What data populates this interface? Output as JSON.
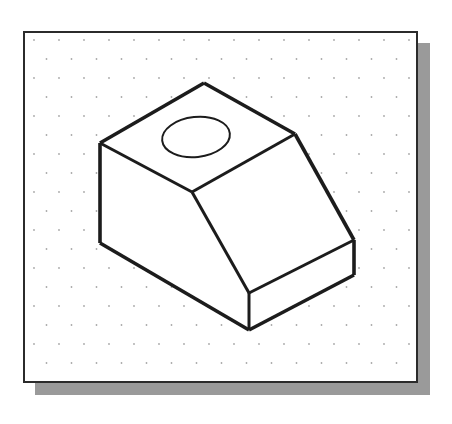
{
  "canvas": {
    "width": 452,
    "height": 424,
    "background": "#ffffff"
  },
  "drawing": {
    "title": "Isometric Sketch of Wedge Block with Counterbore Hole",
    "description": "Hand-drawn style isometric pictorial of a rectangular block with an inclined front face and a circular through hole on the top face, sketched on isometric dot paper.",
    "projection": "isometric",
    "line_color": "#1c1c1c",
    "face_color": "#ffffff"
  },
  "sheet": {
    "name": "isometric-dot-paper",
    "x": 23,
    "y": 31,
    "width": 395,
    "height": 352,
    "border_color": "#2b2b2b",
    "border_width": 2,
    "background": "#ffffff",
    "shadow": {
      "color": "#9a9a9a",
      "offset_x": 12,
      "offset_y": 12
    }
  },
  "grid": {
    "name": "isometric-dot-grid",
    "dot_color": "#a8a8a8",
    "dot_radius": 0.9,
    "spacing_x": 25,
    "spacing_y": 19,
    "stagger": true,
    "columns": 17,
    "rows": 20
  },
  "geometry": {
    "vertices": {
      "top_apex": [
        204,
        83
      ],
      "top_left": [
        100,
        143
      ],
      "top_right": [
        295,
        134
      ],
      "mid_junction": [
        192,
        192
      ],
      "slope_bottom_front": [
        249,
        293
      ],
      "slope_bottom_right": [
        354,
        240
      ],
      "front_bottom": [
        249,
        330
      ],
      "right_bottom": [
        354,
        275
      ],
      "left_bottom": [
        100,
        243
      ]
    },
    "faces": [
      {
        "name": "top-face",
        "points": "100,143 204,83 295,134 192,192"
      },
      {
        "name": "inclined-face",
        "points": "192,192 295,134 354,240 249,293"
      },
      {
        "name": "left-side-face",
        "points": "100,143 192,192 249,293 249,330 100,243"
      },
      {
        "name": "front-bottom-face",
        "points": "249,293 354,240 354,275 249,330"
      }
    ],
    "edges": [
      {
        "name": "top-left-edge",
        "path": "M100,143 L204,83"
      },
      {
        "name": "top-right-edge",
        "path": "M204,83 L295,134"
      },
      {
        "name": "top-inner-left-edge",
        "path": "M100,143 L192,192"
      },
      {
        "name": "top-inner-right-edge",
        "path": "M192,192 L295,134"
      },
      {
        "name": "incline-left-edge",
        "path": "M192,192 L249,293"
      },
      {
        "name": "incline-right-edge",
        "path": "M295,134 L354,240"
      },
      {
        "name": "incline-bottom-edge",
        "path": "M249,293 L354,240"
      },
      {
        "name": "left-vertical-edge",
        "path": "M100,143 L100,243"
      },
      {
        "name": "front-vertical-edge",
        "path": "M249,293 L249,330"
      },
      {
        "name": "right-vertical-edge",
        "path": "M354,240 L354,275"
      },
      {
        "name": "bottom-left-edge",
        "path": "M100,243 L249,330"
      },
      {
        "name": "bottom-right-edge",
        "path": "M249,330 L354,275"
      }
    ],
    "hole": {
      "name": "top-face-hole",
      "shape": "ellipse",
      "center_x": 196,
      "center_y": 137,
      "radius_x": 34,
      "radius_y": 20,
      "rotation_deg": -6
    },
    "stroke_widths": {
      "outline": 3.6,
      "inner": 3.0,
      "hole": 2.0
    }
  }
}
